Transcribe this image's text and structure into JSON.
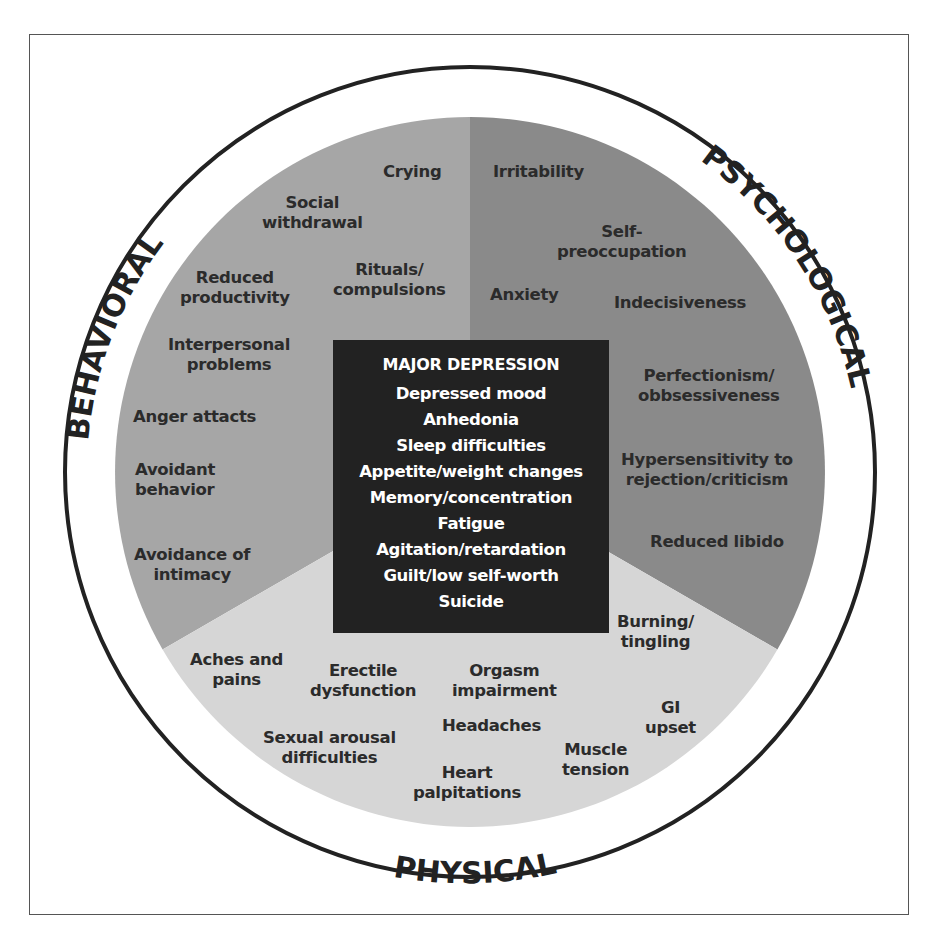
{
  "diagram": {
    "center": {
      "title": "MAJOR DEPRESSION",
      "items": [
        "Depressed mood",
        "Anhedonia",
        "Sleep difficulties",
        "Appetite/weight changes",
        "Memory/concentration",
        "Fatigue",
        "Agitation/retardation",
        "Guilt/low self-worth",
        "Suicide"
      ]
    },
    "sectors": {
      "behavioral": {
        "label": "BEHAVIORAL",
        "color": "#a6a6a6",
        "items": [
          {
            "lines": [
              "Crying"
            ]
          },
          {
            "lines": [
              "Social",
              "withdrawal"
            ]
          },
          {
            "lines": [
              "Reduced",
              "productivity"
            ]
          },
          {
            "lines": [
              "Rituals/",
              "compulsions"
            ]
          },
          {
            "lines": [
              "Interpersonal",
              "problems"
            ]
          },
          {
            "lines": [
              "Anger attacts"
            ]
          },
          {
            "lines": [
              "Avoidant",
              "behavior"
            ]
          },
          {
            "lines": [
              "Avoidance of",
              "intimacy"
            ]
          }
        ]
      },
      "psychological": {
        "label": "PSYCHOLOGICAL",
        "color": "#8a8a8a",
        "items": [
          {
            "lines": [
              "Irritability"
            ]
          },
          {
            "lines": [
              "Self-",
              "preoccupation"
            ]
          },
          {
            "lines": [
              "Anxiety"
            ]
          },
          {
            "lines": [
              "Indecisiveness"
            ]
          },
          {
            "lines": [
              "Perfectionism/",
              "obbsessiveness"
            ]
          },
          {
            "lines": [
              "Hypersensitivity to",
              "rejection/criticism"
            ]
          },
          {
            "lines": [
              "Reduced libido"
            ]
          }
        ]
      },
      "physical": {
        "label": "PHYSICAL",
        "color": "#d6d6d6",
        "items": [
          {
            "lines": [
              "Burning/",
              "tingling"
            ]
          },
          {
            "lines": [
              "Aches and",
              "pains"
            ]
          },
          {
            "lines": [
              "Erectile",
              "dysfunction"
            ]
          },
          {
            "lines": [
              "Orgasm",
              "impairment"
            ]
          },
          {
            "lines": [
              "GI",
              "upset"
            ]
          },
          {
            "lines": [
              "Headaches"
            ]
          },
          {
            "lines": [
              "Sexual arousal",
              "difficulties"
            ]
          },
          {
            "lines": [
              "Muscle",
              "tension"
            ]
          },
          {
            "lines": [
              "Heart",
              "palpitations"
            ]
          }
        ]
      }
    },
    "colors": {
      "center_box": "#222222",
      "ring_stroke": "#222222",
      "label_text": "#2b2b2b"
    }
  }
}
